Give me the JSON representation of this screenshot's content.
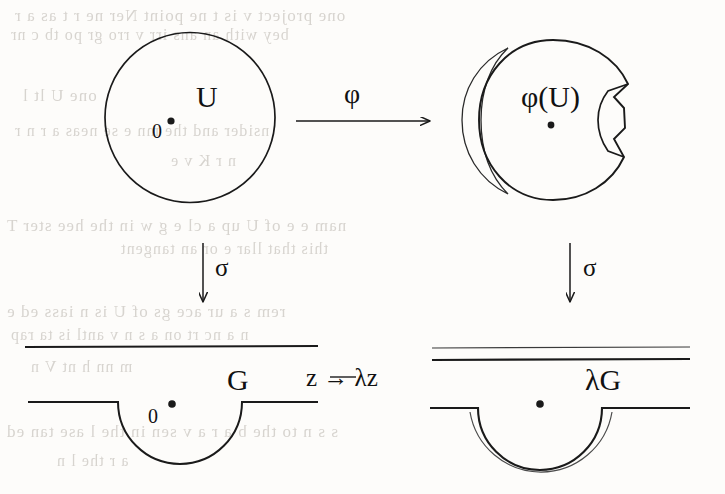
{
  "figure": {
    "kind": "commutative-diagram",
    "ink_color": "#1a1a1a",
    "paper_color": "#fdfcfa",
    "bleed_color": "#b9b4ad"
  },
  "labels": {
    "u": "U",
    "origin_top_left": "0",
    "phi_of_u": "φ(U)",
    "phi_arrow": "φ",
    "sigma_left": "σ",
    "sigma_right": "σ",
    "g": "G",
    "origin_bottom_left": "0",
    "lambda_g": "λG",
    "bottom_map": "z → λz"
  },
  "nodes": [
    {
      "id": "top-left",
      "label": "U",
      "marked_point": "0",
      "shape": "circle",
      "center": [
        190,
        117
      ],
      "radius": 85
    },
    {
      "id": "top-right",
      "label": "φ(U)",
      "marked_point": "",
      "shape": "deformed-disk-with-notch",
      "center": [
        553,
        120
      ],
      "radius": 80
    },
    {
      "id": "bottom-left",
      "label": "G",
      "marked_point": "0",
      "shape": "strip-with-semicircular-indentation",
      "strip_top_y": 347,
      "strip_bottom_y": 402,
      "notch_center_x": 180,
      "notch_radius": 62
    },
    {
      "id": "bottom-right",
      "label": "λG",
      "marked_point": "",
      "shape": "strip-with-doubled-semicircular-indentation",
      "strip_top_y": 348,
      "strip_top_y2": 360,
      "strip_bottom_y": 408,
      "notch_center_x": 540,
      "notch_radius": 62
    }
  ],
  "arrows": [
    {
      "id": "phi",
      "label": "φ",
      "from": "top-left",
      "to": "top-right",
      "direction": "right"
    },
    {
      "id": "sigma-l",
      "label": "σ",
      "from": "top-left",
      "to": "bottom-left",
      "direction": "down"
    },
    {
      "id": "sigma-r",
      "label": "σ",
      "from": "top-right",
      "to": "bottom-right",
      "direction": "down"
    },
    {
      "id": "zmap",
      "label": "z → λz",
      "from": "bottom-left",
      "to": "bottom-right",
      "direction": "right"
    }
  ],
  "bleed_text": [
    {
      "text": "one  project  v is t ne  point    Ner  ne r  t  as a  r",
      "x": 14,
      "y": 6,
      "size": 17
    },
    {
      "text": "bey with  an  ans   irr   v  rro   gr  po   tb  c  nr",
      "x": 10,
      "y": 26,
      "size": 16
    },
    {
      "text": "one        U                      lt       l",
      "x": 22,
      "y": 86,
      "size": 17
    },
    {
      "text": "nsider   and  the   mn  e    se  neas  a  r  n r",
      "x": 14,
      "y": 122,
      "size": 16
    },
    {
      "text": "n      r         K   v      e",
      "x": 170,
      "y": 152,
      "size": 16
    },
    {
      "text": "nam   e   e  of  U   up   a  cl  e  g  w  in  the  hee  ster   T",
      "x": 6,
      "y": 216,
      "size": 17
    },
    {
      "text": "this  that  llar e  or  an  tangent",
      "x": 120,
      "y": 240,
      "size": 16
    },
    {
      "text": "rem  s  a  ur  ace   gs  of  U   is n    iass  ed   e",
      "x": 6,
      "y": 302,
      "size": 17
    },
    {
      "text": "n  a  nc  rt  on   a  s  n   v      antl  is  ta  rap",
      "x": 10,
      "y": 326,
      "size": 16
    },
    {
      "text": "m       nn     h     nt      V                 n",
      "x": 30,
      "y": 358,
      "size": 16
    },
    {
      "text": "s s  n  to  the  b  a  r   a  v  sen  in  the  l  ase   tan  ed",
      "x": 6,
      "y": 422,
      "size": 17
    },
    {
      "text": "a        r   the   l                   n",
      "x": 56,
      "y": 452,
      "size": 16
    }
  ]
}
